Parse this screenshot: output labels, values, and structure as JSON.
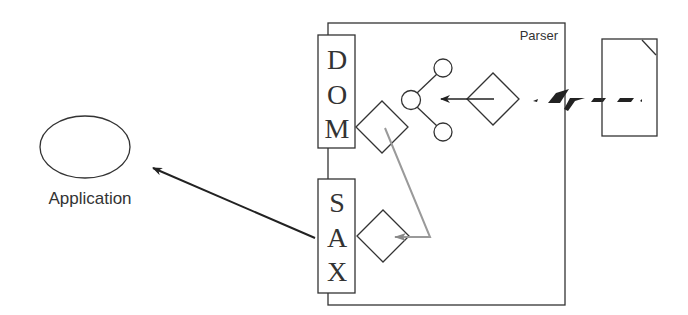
{
  "diagram": {
    "application": {
      "label": "Application"
    },
    "parser": {
      "label": "Parser"
    },
    "dom": {
      "letters": [
        "D",
        "O",
        "M"
      ]
    },
    "sax": {
      "letters": [
        "S",
        "A",
        "X"
      ]
    },
    "colors": {
      "stroke": "#333333",
      "gray_flow": "#9a9a9a",
      "background": "#ffffff"
    }
  }
}
